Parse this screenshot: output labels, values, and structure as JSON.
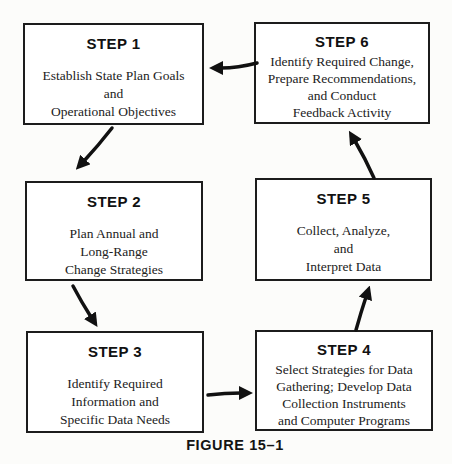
{
  "figure": {
    "caption": "FIGURE 15–1"
  },
  "steps": [
    {
      "id": 1,
      "title": "STEP 1",
      "lines": [
        "Establish State Plan Goals",
        "and",
        "Operational Objectives"
      ]
    },
    {
      "id": 2,
      "title": "STEP 2",
      "lines": [
        "Plan Annual and",
        "Long-Range",
        "Change Strategies"
      ]
    },
    {
      "id": 3,
      "title": "STEP 3",
      "lines": [
        "Identify Required",
        "Information and",
        "Specific Data Needs"
      ]
    },
    {
      "id": 4,
      "title": "STEP 4",
      "lines": [
        "Select Strategies for Data",
        "Gathering; Develop Data",
        "Collection Instruments",
        "and Computer Programs"
      ]
    },
    {
      "id": 5,
      "title": "STEP 5",
      "lines": [
        "Collect, Analyze,",
        "and",
        "Interpret Data"
      ]
    },
    {
      "id": 6,
      "title": "STEP 6",
      "lines": [
        "Identify Required Change,",
        "Prepare Recommendations,",
        "and Conduct",
        "Feedback Activity"
      ]
    }
  ],
  "flow": [
    {
      "from": "STEP 1",
      "to": "STEP 2"
    },
    {
      "from": "STEP 2",
      "to": "STEP 3"
    },
    {
      "from": "STEP 3",
      "to": "STEP 4"
    },
    {
      "from": "STEP 4",
      "to": "STEP 5"
    },
    {
      "from": "STEP 5",
      "to": "STEP 6"
    },
    {
      "from": "STEP 6",
      "to": "STEP 1"
    }
  ],
  "colors": {
    "background": "#fcfcfa",
    "box_fill": "#ffffff",
    "box_border": "#1c1c1c",
    "arrow": "#111111",
    "title_text": "#111111",
    "body_text": "#222222"
  }
}
